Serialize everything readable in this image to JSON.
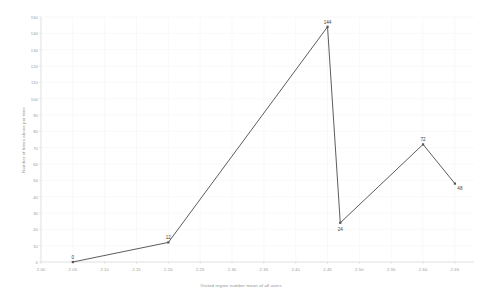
{
  "chart_data": {
    "type": "line",
    "title": "",
    "xlabel": "Visited region number mean of all users",
    "ylabel": "Number of times above per time",
    "x": [
      2.05,
      2.2,
      2.45,
      2.47,
      2.6,
      2.65
    ],
    "values": [
      0,
      12,
      144,
      24,
      72,
      48
    ],
    "point_labels": [
      "0",
      "12",
      "144",
      "24",
      "72",
      "48"
    ],
    "xlim": [
      2.0,
      2.68
    ],
    "ylim": [
      0,
      150
    ],
    "xticks": [
      "2.00",
      "2.05",
      "2.10",
      "2.15",
      "2.20",
      "2.25",
      "2.30",
      "2.35",
      "2.40",
      "2.45",
      "2.50",
      "2.55",
      "2.60",
      "2.65"
    ],
    "yticks": [
      "0",
      "10",
      "20",
      "30",
      "40",
      "50",
      "60",
      "70",
      "80",
      "90",
      "100",
      "110",
      "120",
      "130",
      "140",
      "150"
    ],
    "grid": true,
    "legend": "none",
    "series_color": "#4a4a4a",
    "marker": "square",
    "marker_color": "#555555"
  },
  "style": {
    "background": "#ffffff",
    "grid_color": "#f2f2f2",
    "axis_color": "#d8d8d8",
    "tick_text_color": "#9a9a9a",
    "label_text_color": "#3b3b3b"
  }
}
